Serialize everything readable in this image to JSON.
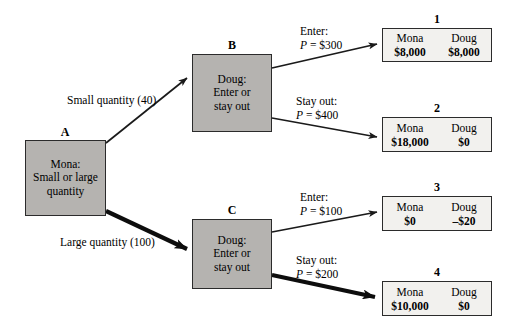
{
  "diagram": {
    "type": "game-tree",
    "colors": {
      "decision_node_fill": "#b5b3b0",
      "payoff_box_fill": "#f2f1ee",
      "stroke": "#2b2b2b",
      "background": "#ffffff"
    }
  },
  "nodes": [
    {
      "id": "A",
      "letter": "A",
      "player": "Mona:",
      "choice_line1": "Small or large",
      "choice_line2": "quantity"
    },
    {
      "id": "B",
      "letter": "B",
      "player": "Doug:",
      "choice_line1": "Enter or",
      "choice_line2": "stay out"
    },
    {
      "id": "C",
      "letter": "C",
      "player": "Doug:",
      "choice_line1": "Enter or",
      "choice_line2": "stay out"
    }
  ],
  "edges": [
    {
      "id": "A-B",
      "label_line1": "Small quantity (40)",
      "label_line2": "",
      "from": "A",
      "to": "B",
      "bold": false
    },
    {
      "id": "A-C",
      "label_line1": "Large quantity (100)",
      "label_line2": "",
      "from": "A",
      "to": "C",
      "bold": true
    },
    {
      "id": "B-1",
      "label_line1": "Enter:",
      "label_line2_prefix": "P",
      "label_line2_rest": " = $300",
      "from": "B",
      "to": "1",
      "bold": false
    },
    {
      "id": "B-2",
      "label_line1": "Stay out:",
      "label_line2_prefix": "P",
      "label_line2_rest": " = $400",
      "from": "B",
      "to": "2",
      "bold": false
    },
    {
      "id": "C-3",
      "label_line1": "Enter:",
      "label_line2_prefix": "P",
      "label_line2_rest": " = $100",
      "from": "C",
      "to": "3",
      "bold": false
    },
    {
      "id": "C-4",
      "label_line1": "Stay out:",
      "label_line2_prefix": "P",
      "label_line2_rest": " = $200",
      "from": "C",
      "to": "4",
      "bold": true
    }
  ],
  "payoffs": [
    {
      "number": "1",
      "player1": "Mona",
      "value1": "$8,000",
      "player2": "Doug",
      "value2": "$8,000"
    },
    {
      "number": "2",
      "player1": "Mona",
      "value1": "$18,000",
      "player2": "Doug",
      "value2": "$0"
    },
    {
      "number": "3",
      "player1": "Mona",
      "value1": "$0",
      "player2": "Doug",
      "value2": "–$20"
    },
    {
      "number": "4",
      "player1": "Mona",
      "value1": "$10,000",
      "player2": "Doug",
      "value2": "$0"
    }
  ]
}
